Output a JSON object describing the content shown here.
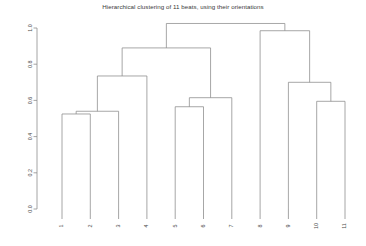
{
  "chart_data": {
    "type": "dendrogram",
    "title": "Hierarchical clustering of 11 beats, using their orientations",
    "xlabel": "",
    "ylabel": "",
    "ylim": [
      0.0,
      1.06
    ],
    "grid": false,
    "legend": null,
    "ytick_labels": [
      "1.0",
      "0.8",
      "0.6",
      "0.4",
      "0.2",
      "0.0"
    ],
    "ytick_values": [
      1.0,
      0.8,
      0.6,
      0.4,
      0.2,
      0.0
    ],
    "leaf_labels": [
      "1",
      "2",
      "3",
      "4",
      "5",
      "6",
      "7",
      "8",
      "9",
      "10",
      "11"
    ],
    "leaf_order": [
      1,
      2,
      3,
      4,
      5,
      6,
      7,
      8,
      9,
      10,
      11
    ],
    "orientation": "top",
    "merges": [
      {
        "id": "m1",
        "children": [
          "1",
          "2"
        ],
        "height": 0.525
      },
      {
        "id": "m2",
        "children": [
          "m1",
          "3"
        ],
        "height": 0.54
      },
      {
        "id": "m3",
        "children": [
          "5",
          "6"
        ],
        "height": 0.565
      },
      {
        "id": "m4",
        "children": [
          "10",
          "11"
        ],
        "height": 0.595
      },
      {
        "id": "m5",
        "children": [
          "m3",
          "7"
        ],
        "height": 0.615
      },
      {
        "id": "m6",
        "children": [
          "9",
          "m4"
        ],
        "height": 0.7
      },
      {
        "id": "m7",
        "children": [
          "m2",
          "4"
        ],
        "height": 0.735
      },
      {
        "id": "m8",
        "children": [
          "m7",
          "m5"
        ],
        "height": 0.89
      },
      {
        "id": "m9",
        "children": [
          "8",
          "m6"
        ],
        "height": 0.985
      },
      {
        "id": "m10",
        "children": [
          "m8",
          "m9"
        ],
        "height": 1.025
      }
    ],
    "colors": {
      "line": "#8a8a8a",
      "axis": "#8d8d8d",
      "text": "#4a4a4a",
      "title": "#3a3a3a",
      "background": "#ffffff"
    }
  }
}
